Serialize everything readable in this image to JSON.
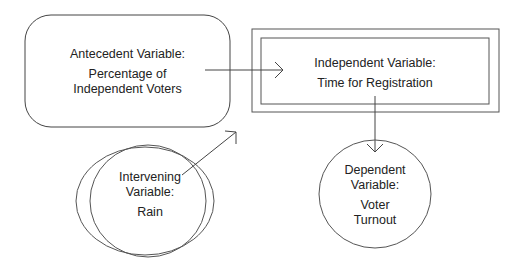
{
  "nodes": {
    "antecedent": {
      "shape": "rounded-rectangle",
      "heading": "Antecedent Variable:",
      "line1": "Percentage of",
      "line2": "Independent Voters"
    },
    "independent": {
      "shape": "double-rectangle",
      "heading": "Independent Variable:",
      "line1": "Time for Registration"
    },
    "intervening": {
      "shape": "double-ellipse",
      "heading1": "Intervening",
      "heading2": "Variable:",
      "line1": "Rain"
    },
    "dependent": {
      "shape": "circle",
      "heading1": "Dependent",
      "heading2": "Variable:",
      "line1": "Voter",
      "line2": "Turnout"
    }
  },
  "edges": [
    {
      "from": "antecedent",
      "to": "independent"
    },
    {
      "from": "independent",
      "to": "dependent"
    },
    {
      "from": "intervening",
      "to": "antecedent-independent-link"
    }
  ],
  "colors": {
    "stroke": "#444444",
    "text": "#222222",
    "background": "#ffffff"
  }
}
